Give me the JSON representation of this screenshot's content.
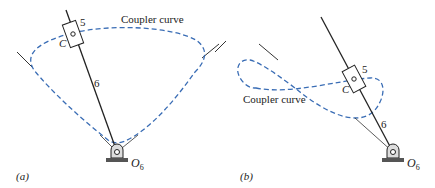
{
  "panels": [
    {
      "id": "a",
      "label": "(a)",
      "curve_label": "Coupler curve",
      "slider_label": "5",
      "point_label": "C",
      "link_label": "6",
      "pivot_label": "O",
      "pivot_sub": "6"
    },
    {
      "id": "b",
      "label": "(b)",
      "curve_label": "Coupler curve",
      "slider_label": "5",
      "point_label": "C",
      "link_label": "6",
      "pivot_label": "O",
      "pivot_sub": "6"
    }
  ],
  "colors": {
    "curve": "#3a6db5",
    "line": "#222222"
  }
}
